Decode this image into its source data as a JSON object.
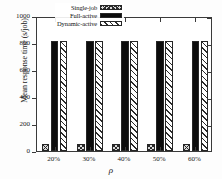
{
  "chart_data": {
    "type": "bar",
    "title": "",
    "xlabel": "ρ",
    "ylabel": "Mean response time (s/job)",
    "categories": [
      "20%",
      "30%",
      "40%",
      "50%",
      "60%"
    ],
    "ylim": [
      0,
      1000
    ],
    "yticks": [
      0,
      200,
      400,
      600,
      800,
      1000
    ],
    "ytick_labels": [
      "0",
      "200",
      "400",
      "600",
      "800",
      "1000"
    ],
    "grid": false,
    "legend_position": "top-center",
    "series": [
      {
        "name": "Single-job",
        "pattern": "cross-hatch",
        "values": [
          50,
          50,
          50,
          50,
          50
        ]
      },
      {
        "name": "Full-active",
        "pattern": "solid-black",
        "values": [
          815,
          815,
          815,
          815,
          815
        ]
      },
      {
        "name": "Dynamic-active",
        "pattern": "diagonal-hatch",
        "values": [
          815,
          815,
          815,
          815,
          815
        ]
      }
    ]
  },
  "colors": {
    "axis": "#3a3a3a",
    "text": "#1a1a1a",
    "bar_solid": "#0c0c0c",
    "bar_hatch_line": "#2b2b2b",
    "background": "#ffffff"
  }
}
